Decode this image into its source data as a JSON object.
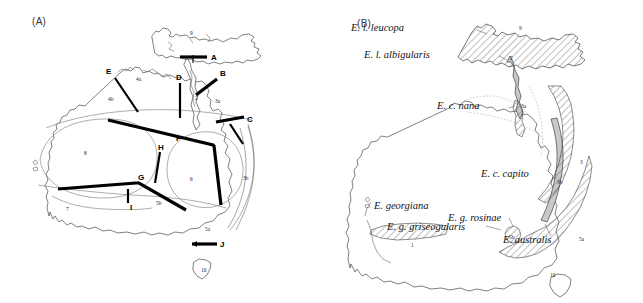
{
  "figure": {
    "background_color": "#ffffff",
    "line_color": "#000000",
    "coast_color": "#4a4a4a"
  },
  "panel_a": {
    "label": "(A)",
    "caption": "",
    "barriers": [
      {
        "id": "A",
        "label": "A"
      },
      {
        "id": "B",
        "label": "B"
      },
      {
        "id": "C",
        "label": "C"
      },
      {
        "id": "D",
        "label": "D"
      },
      {
        "id": "E",
        "label": "E"
      },
      {
        "id": "F",
        "label": "F"
      },
      {
        "id": "G",
        "label": "G"
      },
      {
        "id": "H",
        "label": "H"
      },
      {
        "id": "I",
        "label": "I"
      },
      {
        "id": "J",
        "label": "J"
      }
    ],
    "regions": [
      {
        "id": "r1",
        "label": "1"
      },
      {
        "id": "r2",
        "label": "2"
      },
      {
        "id": "r3a",
        "label": "3a"
      },
      {
        "id": "r3b",
        "label": "3b"
      },
      {
        "id": "r4a",
        "label": "4a"
      },
      {
        "id": "r4b",
        "label": "4b"
      },
      {
        "id": "r5a",
        "label": "5a"
      },
      {
        "id": "r5b",
        "label": "5b"
      },
      {
        "id": "r6",
        "label": "6"
      },
      {
        "id": "r7",
        "label": "7"
      },
      {
        "id": "r8",
        "label": "8"
      },
      {
        "id": "r9",
        "label": "9"
      },
      {
        "id": "r10",
        "label": "10"
      }
    ]
  },
  "panel_b": {
    "label": "(B)",
    "taxa": [
      {
        "id": "leucopa",
        "name": "E. l. leucopa",
        "region": "9"
      },
      {
        "id": "albigularis",
        "name": "E. l. albigularis",
        "region": "2"
      },
      {
        "id": "nana",
        "name": "E. c. nana",
        "region": "3a"
      },
      {
        "id": "capito",
        "name": "E. c. capito",
        "region": "3b"
      },
      {
        "id": "australis",
        "name": "E. australis",
        "region": "5a"
      },
      {
        "id": "rosinae",
        "name": "E. g. rosinae",
        "region": "5b"
      },
      {
        "id": "griseogularis",
        "name": "E. g. griseogularis",
        "region": "1"
      },
      {
        "id": "georgiana",
        "name": "E. georgiana",
        "region": ""
      }
    ],
    "regions": [
      {
        "id": "b9",
        "label": "9"
      },
      {
        "id": "b2",
        "label": "2"
      },
      {
        "id": "b3a",
        "label": "3a"
      },
      {
        "id": "b3",
        "label": "3"
      },
      {
        "id": "b3b",
        "label": "3b"
      },
      {
        "id": "b5a",
        "label": "5a"
      },
      {
        "id": "b5b",
        "label": "5b"
      },
      {
        "id": "b1",
        "label": "1"
      },
      {
        "id": "b10",
        "label": "10"
      }
    ]
  }
}
